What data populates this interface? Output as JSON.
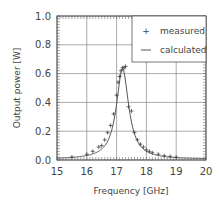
{
  "chart_data": {
    "type": "line",
    "title": "",
    "xlabel": "Frequency [GHz]",
    "ylabel": "Output power [W]",
    "xlim": [
      15,
      20
    ],
    "ylim": [
      0.0,
      1.0
    ],
    "xticks": [
      15,
      16,
      17,
      18,
      19,
      20
    ],
    "yticks": [
      0.0,
      0.2,
      0.4,
      0.6,
      0.8,
      1.0
    ],
    "xtick_labels": [
      "15",
      "16",
      "17",
      "18",
      "19",
      "20"
    ],
    "ytick_labels": [
      "0.0",
      "0.2",
      "0.4",
      "0.6",
      "0.8",
      "1.0"
    ],
    "grid": true,
    "legend_position": "upper right",
    "series": [
      {
        "name": "measured",
        "marker": "+",
        "x": [
          15.5,
          16.0,
          16.2,
          16.4,
          16.5,
          16.6,
          16.7,
          16.8,
          16.9,
          17.0,
          17.05,
          17.1,
          17.15,
          17.2,
          17.25,
          17.3,
          17.4,
          17.5,
          17.6,
          17.7,
          17.8,
          17.9,
          18.0,
          18.1,
          18.2,
          18.4,
          18.6,
          18.8,
          19.0
        ],
        "y": [
          0.02,
          0.04,
          0.06,
          0.09,
          0.1,
          0.14,
          0.19,
          0.24,
          0.32,
          0.45,
          0.54,
          0.58,
          0.62,
          0.64,
          0.64,
          0.65,
          0.37,
          0.34,
          0.19,
          0.14,
          0.11,
          0.09,
          0.07,
          0.06,
          0.05,
          0.04,
          0.03,
          0.025,
          0.02
        ]
      },
      {
        "name": "calculated",
        "marker": "line",
        "center": 17.2,
        "peak": 0.63,
        "half_width": 0.25,
        "x": [
          15.0,
          15.5,
          16.0,
          16.3,
          16.5,
          16.7,
          16.8,
          16.9,
          17.0,
          17.05,
          17.1,
          17.15,
          17.2,
          17.25,
          17.3,
          17.35,
          17.4,
          17.5,
          17.6,
          17.7,
          17.8,
          18.0,
          18.3,
          18.6,
          19.0,
          19.5,
          20.0
        ],
        "y": [
          0.01,
          0.02,
          0.03,
          0.05,
          0.07,
          0.12,
          0.17,
          0.25,
          0.38,
          0.47,
          0.55,
          0.61,
          0.63,
          0.61,
          0.55,
          0.47,
          0.38,
          0.25,
          0.17,
          0.12,
          0.09,
          0.06,
          0.04,
          0.03,
          0.02,
          0.015,
          0.01
        ]
      }
    ]
  },
  "legend": {
    "items": [
      {
        "label": "measured",
        "symbol": "+"
      },
      {
        "label": "calculated",
        "symbol": "—"
      }
    ]
  },
  "colors": {
    "axis": "#555555",
    "grid": "#888888",
    "line": "#555555",
    "marker": "#444444",
    "text": "#444444"
  }
}
